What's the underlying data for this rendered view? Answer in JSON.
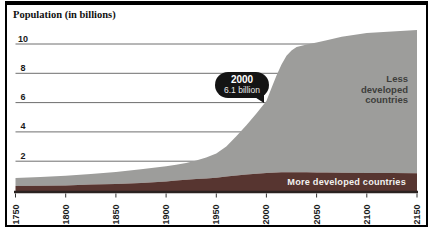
{
  "title": "Population (in billions)",
  "callout": {
    "year": "2000",
    "value": "6.1 billion"
  },
  "area_labels": {
    "less_developed": "Less developed countries",
    "more_developed": "More developed countries"
  },
  "colors": {
    "less_developed_area": "#9d9d9b",
    "more_developed_area": "#573530",
    "gridline": "#6e6e6e",
    "axis_text": "#1a1a1a",
    "tick_mark": "#333333",
    "baseline": "#2a2220",
    "frame": "#000000",
    "callout_bg": "#141414",
    "callout_text": "#ffffff",
    "less_label_text": "#3d3d3b",
    "more_label_text": "#f2f1ef"
  },
  "chart_data": {
    "type": "area",
    "stacked": true,
    "title": "Population (in billions)",
    "grid": "horizontal",
    "legend_position": "labels-on-areas",
    "x_range": [
      1750,
      2150
    ],
    "y_range": [
      0,
      11.5
    ],
    "x_ticks": [
      1750,
      1800,
      1850,
      1900,
      1950,
      2000,
      2050,
      2100,
      2150
    ],
    "y_ticks": [
      2,
      4,
      6,
      8,
      10
    ],
    "x": [
      1750,
      1775,
      1800,
      1825,
      1850,
      1875,
      1900,
      1910,
      1920,
      1930,
      1940,
      1950,
      1960,
      1970,
      1980,
      1990,
      2000,
      2005,
      2010,
      2015,
      2020,
      2025,
      2030,
      2040,
      2050,
      2060,
      2075,
      2100,
      2125,
      2150
    ],
    "series": [
      {
        "name": "More developed countries",
        "values": [
          0.3,
          0.32,
          0.35,
          0.4,
          0.45,
          0.52,
          0.62,
          0.68,
          0.73,
          0.78,
          0.82,
          0.87,
          0.95,
          1.02,
          1.09,
          1.15,
          1.2,
          1.21,
          1.23,
          1.24,
          1.24,
          1.25,
          1.25,
          1.24,
          1.23,
          1.22,
          1.21,
          1.2,
          1.19,
          1.18
        ]
      },
      {
        "name": "Less developed countries",
        "values": [
          0.55,
          0.6,
          0.65,
          0.72,
          0.81,
          0.93,
          1.04,
          1.08,
          1.15,
          1.27,
          1.43,
          1.65,
          2.05,
          2.68,
          3.36,
          4.1,
          4.9,
          5.79,
          6.62,
          7.36,
          7.96,
          8.3,
          8.55,
          8.73,
          8.87,
          9.03,
          9.29,
          9.55,
          9.66,
          9.77
        ]
      }
    ],
    "annotation": {
      "x": 2000,
      "total": 6.1,
      "label": "2000 — 6.1 billion"
    }
  }
}
